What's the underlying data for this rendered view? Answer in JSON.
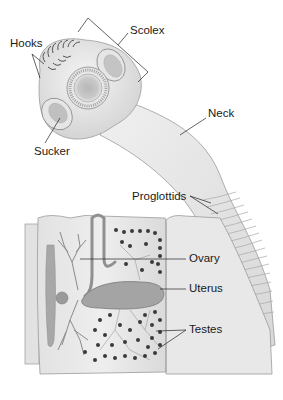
{
  "diagram": {
    "labels": {
      "hooks": "Hooks",
      "scolex": "Scolex",
      "sucker": "Sucker",
      "neck": "Neck",
      "proglottids": "Proglottids",
      "ovary": "Ovary",
      "uterus": "Uterus",
      "testes": "Testes"
    },
    "colors": {
      "background": "#ffffff",
      "body_fill": "#ededed",
      "body_shade": "#d6d6d6",
      "outline": "#8a8a8a",
      "organ_fill": "#9c9c9c",
      "testes_dots": "#3a3a3a",
      "leader_lines": "#222222"
    }
  }
}
